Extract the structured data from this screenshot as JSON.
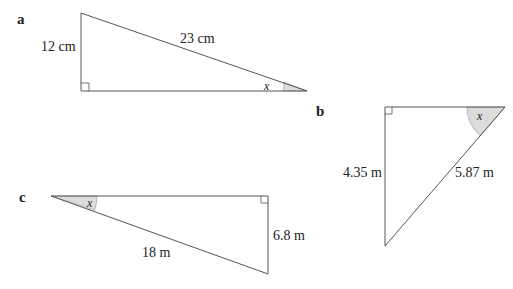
{
  "figures": [
    {
      "id": "a",
      "label": "a",
      "vertical_side": "12 cm",
      "hypotenuse": "23 cm",
      "angle": "x",
      "vertices": {
        "top": [
          81,
          13
        ],
        "right_angle": [
          81,
          91
        ],
        "angle_vertex": [
          307,
          91
        ]
      }
    },
    {
      "id": "b",
      "label": "b",
      "vertical_side": "4.35 m",
      "hypotenuse": "5.87 m",
      "angle": "x",
      "vertices": {
        "right_angle": [
          385,
          107
        ],
        "angle_vertex": [
          505,
          107
        ],
        "bottom": [
          385,
          246
        ]
      }
    },
    {
      "id": "c",
      "label": "c",
      "vertical_side": "6.8 m",
      "hypotenuse": "18 m",
      "angle": "x",
      "vertices": {
        "angle_vertex": [
          51,
          196
        ],
        "right_angle": [
          268,
          196
        ],
        "bottom": [
          268,
          274
        ]
      }
    }
  ],
  "colors": {
    "line": "#555555",
    "angle_fill": "#dcdcdc",
    "text": "#222222"
  }
}
